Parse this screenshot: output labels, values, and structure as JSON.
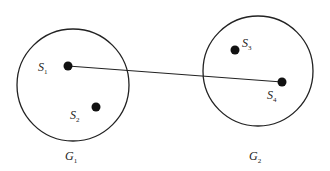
{
  "diagram": {
    "groups": [
      {
        "id": "G1",
        "letter": "G",
        "sub": "1",
        "cx": 73,
        "cy": 85,
        "r": 56,
        "label_x": 65,
        "label_y": 160
      },
      {
        "id": "G2",
        "letter": "G",
        "sub": "2",
        "cx": 258,
        "cy": 71,
        "r": 55,
        "label_x": 249,
        "label_y": 160
      }
    ],
    "nodes": [
      {
        "id": "S1",
        "letter": "S",
        "sub": "1",
        "x": 68,
        "y": 66,
        "label_x": 38,
        "label_y": 71
      },
      {
        "id": "S2",
        "letter": "S",
        "sub": "2",
        "x": 96,
        "y": 107,
        "label_x": 70,
        "label_y": 119
      },
      {
        "id": "S3",
        "letter": "S",
        "sub": "3",
        "x": 235,
        "y": 50,
        "label_x": 242,
        "label_y": 47
      },
      {
        "id": "S4",
        "letter": "S",
        "sub": "4",
        "x": 282,
        "y": 82,
        "label_x": 267,
        "label_y": 99
      }
    ],
    "edges": [
      {
        "from": "S1",
        "to": "S4"
      }
    ],
    "colors": {
      "stroke": "#222222",
      "dot": "#111111",
      "background": "#ffffff"
    }
  }
}
